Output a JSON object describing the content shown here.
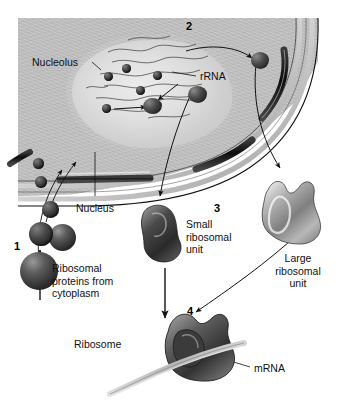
{
  "figure": {
    "background_color": "#ffffff"
  },
  "step_numbers": [
    {
      "id": "1",
      "label": "1",
      "x": 14,
      "y": 240
    },
    {
      "id": "2",
      "label": "2",
      "x": 186,
      "y": 20
    },
    {
      "id": "3",
      "label": "3",
      "x": 214,
      "y": 202
    },
    {
      "id": "4",
      "label": "4",
      "x": 187,
      "y": 305
    }
  ],
  "labels": {
    "nucleolus": "Nucleolus",
    "rrna": "rRNA",
    "nucleus": "Nucleus",
    "small_subunit": "Small\nribosomal\nunit",
    "large_subunit": "Large\nribosomal\nunit",
    "ribosomal_proteins": "Ribosomal\nproteins from\ncytoplasm",
    "ribosome": "Ribosome",
    "mrna": "mRNA"
  },
  "colors": {
    "nucleoplasm": "#c3c3c3",
    "nucleolus": "#dadada",
    "membrane_dark": "#1a1a1a",
    "membrane_light": "#f2f2f2",
    "protein_particle": "#2c2c2c",
    "small_subunit": "#3a3a3a",
    "large_subunit": "#9b9b9b",
    "mrna_strand": "#c9c9c9",
    "text": "#101010"
  },
  "structures": [
    {
      "name": "nucleolus",
      "description": "granular oval region inside nucleus where rRNA and proteins assemble"
    },
    {
      "name": "nuclear-envelope",
      "description": "curved double membrane with nuclear pores"
    },
    {
      "name": "small-ribosomal-unit",
      "description": "dark lobed subunit exiting nucleus"
    },
    {
      "name": "large-ribosomal-unit",
      "description": "light grey lobed subunit exiting nucleus"
    },
    {
      "name": "ribosome",
      "description": "assembled subunits bound to mRNA strand"
    }
  ]
}
